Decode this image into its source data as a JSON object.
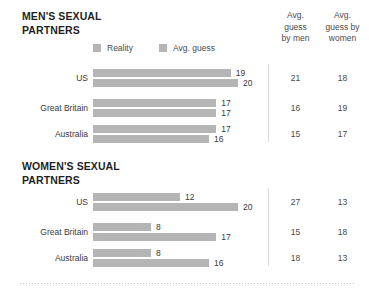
{
  "columns": {
    "men_header": "Avg. guess by men",
    "men_header_lines": [
      "Avg.",
      "guess",
      "by men"
    ],
    "women_header": "Avg. guess by women",
    "women_header_lines": [
      "Avg.",
      "guess by",
      "women"
    ]
  },
  "legend": {
    "reality": "Reality",
    "avg_guess": "Avg. guess"
  },
  "sections": [
    {
      "title_line1": "MEN'S SEXUAL",
      "title_line2": "PARTNERS"
    },
    {
      "title_line1": "WOMEN'S SEXUAL",
      "title_line2": "PARTNERS"
    }
  ],
  "chart_data": {
    "type": "bar",
    "xlabel": "",
    "ylabel": "",
    "orientation": "horizontal",
    "grid": false,
    "legend_position": "top-left",
    "axis_max": 21,
    "series_names": [
      "Reality",
      "Avg. guess"
    ],
    "bar_color": "#b5b5b5",
    "panels": [
      {
        "name": "MEN'S SEXUAL PARTNERS",
        "categories": [
          "US",
          "Great Britain",
          "Australia"
        ],
        "series": [
          {
            "name": "Reality",
            "values": [
              19,
              17,
              17
            ]
          },
          {
            "name": "Avg. guess",
            "values": [
              20,
              17,
              16
            ]
          }
        ],
        "table_columns": [
          "Avg. guess by men",
          "Avg. guess by women"
        ],
        "table_values": [
          [
            21,
            18
          ],
          [
            16,
            19
          ],
          [
            15,
            17
          ]
        ]
      },
      {
        "name": "WOMEN'S SEXUAL PARTNERS",
        "categories": [
          "US",
          "Great Britain",
          "Australia"
        ],
        "series": [
          {
            "name": "Reality",
            "values": [
              12,
              8,
              8
            ]
          },
          {
            "name": "Avg. guess",
            "values": [
              20,
              17,
              16
            ]
          }
        ],
        "table_columns": [
          "Avg. guess by men",
          "Avg. guess by women"
        ],
        "table_values": [
          [
            27,
            13
          ],
          [
            15,
            18
          ],
          [
            18,
            13
          ]
        ]
      }
    ]
  }
}
